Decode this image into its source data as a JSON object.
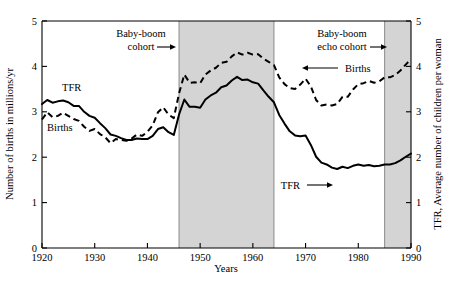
{
  "chart_data": {
    "type": "line",
    "title": "",
    "xlabel": "Years",
    "ylabel": "Number of births in millions/yr",
    "y2label": "TFR, Average number of children per woman",
    "xlim": [
      1920,
      1990
    ],
    "ylim": [
      0,
      5
    ],
    "y2lim": [
      0,
      5
    ],
    "grid": false,
    "legend_position": "inline-annotations",
    "xticks": [
      "1920",
      "1930",
      "1940",
      "1950",
      "1960",
      "1970",
      "1980",
      "1990"
    ],
    "xtick_values": [
      1920,
      1930,
      1940,
      1950,
      1960,
      1970,
      1980,
      1990
    ],
    "yticks": [
      "0",
      "1",
      "2",
      "3",
      "4",
      "5"
    ],
    "ytick_values": [
      0,
      1,
      2,
      3,
      4,
      5
    ],
    "y2ticks": [
      "0",
      "1",
      "2",
      "3",
      "4",
      "5"
    ],
    "y2tick_values": [
      0,
      1,
      2,
      3,
      4,
      5
    ],
    "series": [
      {
        "name": "TFR",
        "style": "solid",
        "axis": "right",
        "units": "children per woman",
        "x": [
          1920,
          1921,
          1922,
          1923,
          1924,
          1925,
          1926,
          1927,
          1928,
          1929,
          1930,
          1931,
          1932,
          1933,
          1934,
          1935,
          1936,
          1937,
          1938,
          1939,
          1940,
          1941,
          1942,
          1943,
          1944,
          1945,
          1946,
          1947,
          1948,
          1949,
          1950,
          1951,
          1952,
          1953,
          1954,
          1955,
          1956,
          1957,
          1958,
          1959,
          1960,
          1961,
          1962,
          1963,
          1964,
          1965,
          1966,
          1967,
          1968,
          1969,
          1970,
          1971,
          1972,
          1973,
          1974,
          1975,
          1976,
          1977,
          1978,
          1979,
          1980,
          1981,
          1982,
          1983,
          1984,
          1985,
          1986,
          1987,
          1988,
          1989,
          1990
        ],
        "values": [
          3.17,
          3.26,
          3.2,
          3.23,
          3.25,
          3.21,
          3.13,
          3.13,
          3.0,
          2.91,
          2.87,
          2.75,
          2.64,
          2.5,
          2.47,
          2.42,
          2.38,
          2.38,
          2.41,
          2.4,
          2.4,
          2.47,
          2.62,
          2.66,
          2.55,
          2.49,
          2.94,
          3.27,
          3.11,
          3.11,
          3.09,
          3.27,
          3.36,
          3.42,
          3.54,
          3.58,
          3.69,
          3.77,
          3.7,
          3.71,
          3.65,
          3.62,
          3.47,
          3.33,
          3.21,
          2.93,
          2.74,
          2.57,
          2.48,
          2.46,
          2.48,
          2.27,
          2.01,
          1.88,
          1.84,
          1.77,
          1.74,
          1.79,
          1.76,
          1.81,
          1.84,
          1.81,
          1.83,
          1.8,
          1.81,
          1.84,
          1.84,
          1.87,
          1.93,
          2.01,
          2.08
        ]
      },
      {
        "name": "Births",
        "style": "dashed",
        "axis": "left",
        "units": "millions/yr",
        "x": [
          1920,
          1921,
          1922,
          1923,
          1924,
          1925,
          1926,
          1927,
          1928,
          1929,
          1930,
          1931,
          1932,
          1933,
          1934,
          1935,
          1936,
          1937,
          1938,
          1939,
          1940,
          1941,
          1942,
          1943,
          1944,
          1945,
          1946,
          1947,
          1948,
          1949,
          1950,
          1951,
          1952,
          1953,
          1954,
          1955,
          1956,
          1957,
          1958,
          1959,
          1960,
          1961,
          1962,
          1963,
          1964,
          1965,
          1966,
          1967,
          1968,
          1969,
          1970,
          1971,
          1972,
          1973,
          1974,
          1975,
          1976,
          1977,
          1978,
          1979,
          1980,
          1981,
          1982,
          1983,
          1984,
          1985,
          1986,
          1987,
          1988,
          1989,
          1990
        ],
        "values": [
          2.83,
          2.99,
          2.88,
          2.91,
          2.98,
          2.91,
          2.84,
          2.8,
          2.67,
          2.58,
          2.62,
          2.51,
          2.44,
          2.31,
          2.4,
          2.38,
          2.36,
          2.41,
          2.5,
          2.47,
          2.56,
          2.7,
          2.99,
          3.1,
          2.94,
          2.86,
          3.41,
          3.82,
          3.64,
          3.65,
          3.63,
          3.82,
          3.91,
          3.97,
          4.08,
          4.1,
          4.22,
          4.31,
          4.26,
          4.3,
          4.26,
          4.27,
          4.17,
          4.1,
          4.03,
          3.76,
          3.61,
          3.52,
          3.5,
          3.6,
          3.73,
          3.56,
          3.26,
          3.14,
          3.16,
          3.14,
          3.17,
          3.33,
          3.33,
          3.49,
          3.61,
          3.63,
          3.68,
          3.64,
          3.67,
          3.76,
          3.76,
          3.81,
          3.91,
          4.04,
          4.16
        ]
      }
    ],
    "shaded_bands": [
      {
        "label": "Baby-boom cohort",
        "x_start": 1946,
        "x_end": 1964,
        "color": "#d4d4d4"
      },
      {
        "label": "Baby-boom echo cohort",
        "x_start": 1985,
        "x_end": 1990,
        "color": "#d4d4d4"
      }
    ],
    "annotations": [
      {
        "id": "baby-boom-cohort",
        "text_line1": "Baby-boom",
        "text_line2": "cohort",
        "arrow": "right"
      },
      {
        "id": "baby-boom-echo-cohort",
        "text_line1": "Baby-boom",
        "text_line2": "echo cohort",
        "arrow": "right"
      },
      {
        "id": "births-pointer",
        "text": "Births",
        "arrow": "left"
      },
      {
        "id": "tfr-pointer",
        "text": "TFR",
        "arrow": "right"
      },
      {
        "id": "tfr-inline",
        "text": "TFR",
        "arrow": "none"
      },
      {
        "id": "births-inline",
        "text": "Births",
        "arrow": "none"
      }
    ]
  },
  "labels": {
    "tfr_inline": "TFR",
    "births_inline": "Births",
    "baby_boom_l1": "Baby-boom",
    "baby_boom_l2": "cohort",
    "echo_l1": "Baby-boom",
    "echo_l2": "echo cohort",
    "births_pointer": "Births",
    "tfr_pointer": "TFR",
    "x_axis_title": "Years",
    "y_axis_title": "Number of births in millions/yr",
    "y2_axis_title": "TFR, Average number of children per woman"
  }
}
